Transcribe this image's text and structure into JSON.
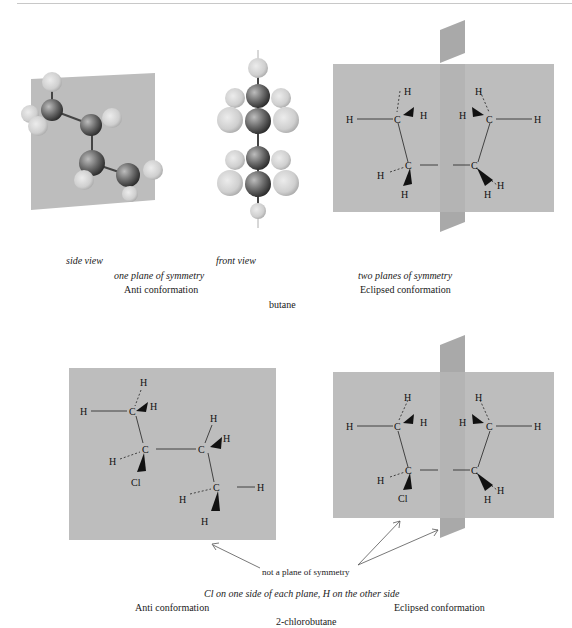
{
  "figure": {
    "colors": {
      "plane": "#b9b9b9",
      "plane_dark": "#a9a9a9",
      "carbon": "#6e6e6e",
      "hydrogen": "#d2d2d2",
      "bond": "#333333",
      "text": "#1a1a1a",
      "arrow": "#555555"
    }
  },
  "butane": {
    "title": "butane",
    "anti": {
      "side_view_label": "side view",
      "front_view_label": "front view",
      "symmetry_note": "one plane of symmetry",
      "conformation_label": "Anti conformation"
    },
    "eclipsed": {
      "symmetry_note": "two planes of symmetry",
      "conformation_label": "Eclipsed conformation",
      "atoms": {
        "c": "C",
        "h": "H"
      }
    }
  },
  "chlorobutane": {
    "title": "2-chlorobutane",
    "anti": {
      "conformation_label": "Anti conformation",
      "atoms": {
        "c": "C",
        "h": "H",
        "cl": "Cl"
      }
    },
    "eclipsed": {
      "conformation_label": "Eclipsed conformation",
      "atoms": {
        "c": "C",
        "h": "H",
        "cl": "Cl"
      }
    },
    "annotation": "not a plane of symmetry",
    "note": "Cl on one side of each plane, H on the other side"
  }
}
